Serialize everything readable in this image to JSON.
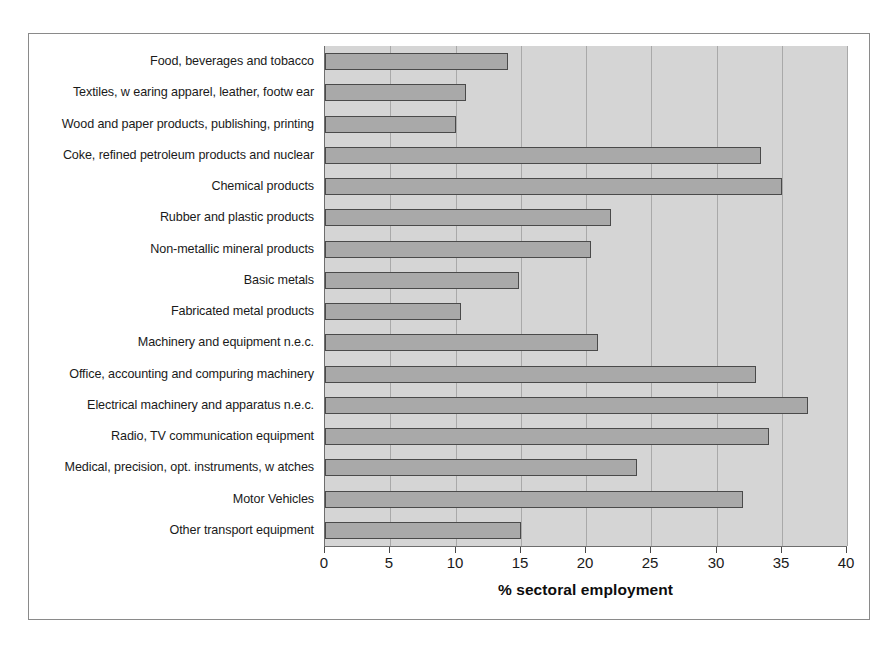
{
  "chart_data": {
    "type": "bar",
    "orientation": "horizontal",
    "title": "",
    "xlabel": "% sectoral employment",
    "ylabel": "",
    "xlim": [
      0,
      40
    ],
    "xticks": [
      0,
      5,
      10,
      15,
      20,
      25,
      30,
      35,
      40
    ],
    "grid": true,
    "legend": "none",
    "categories": [
      "Food, beverages and tobacco",
      "Textiles, w earing apparel, leather, footw ear",
      "Wood and paper products, publishing, printing",
      "Coke, refined petroleum products and nuclear",
      "Chemical products",
      "Rubber and plastic products",
      "Non-metallic mineral products",
      "Basic metals",
      "Fabricated metal products",
      "Machinery and equipment n.e.c.",
      "Office, accounting and compuring machinery",
      "Electrical machinery and apparatus n.e.c.",
      "Radio, TV communication equipment",
      "Medical, precision, opt. instruments, w atches",
      "Motor Vehicles",
      "Other transport equipment"
    ],
    "values": [
      14.0,
      10.8,
      10.0,
      33.4,
      35.0,
      21.9,
      20.4,
      14.9,
      10.4,
      20.9,
      33.0,
      37.0,
      34.0,
      23.9,
      32.0,
      15.0
    ],
    "colors": {
      "bar_fill": "#a9a9a9",
      "bar_border": "#4a4a4a",
      "plot_background": "#d5d5d5",
      "gridline": "#a9a9a9",
      "axis": "#6e6e6e",
      "frame": "#8a8a8a",
      "text": "#1a1a1a"
    }
  }
}
